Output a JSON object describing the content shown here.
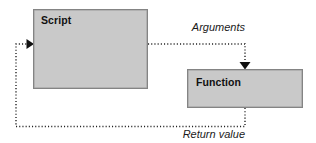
{
  "diagram": {
    "canvas": {
      "width": 316,
      "height": 143,
      "background": "#ffffff"
    },
    "style": {
      "node_fill": "#c9c9c9",
      "node_border": "#848484",
      "edge_color": "#222222",
      "text_color": "#111111"
    },
    "nodes": [
      {
        "id": "script",
        "label": "Script",
        "x": 33,
        "y": 9,
        "width": 115,
        "height": 80,
        "label_x": 41,
        "label_y": 14
      },
      {
        "id": "function",
        "label": "Function",
        "x": 187,
        "y": 69,
        "width": 116,
        "height": 39,
        "label_x": 196,
        "label_y": 76
      }
    ],
    "edges": [
      {
        "id": "arguments-edge",
        "label": "Arguments",
        "from": "script",
        "to": "function",
        "style": "dotted",
        "arrowhead": "down",
        "path": "M148,44 L245,44 L245,64",
        "arrow_points": "239,63 251,63 245,70",
        "label_x": 245,
        "label_y": 22
      },
      {
        "id": "return-value-edge",
        "label": "Return value",
        "from": "function",
        "to": "script",
        "style": "dotted",
        "arrowhead": "right",
        "path": "M245,108 L245,126 L16,126 L16,44 L28,44",
        "arrow_points": "27,39 27,49 34,44",
        "label_x": 245,
        "label_y": 129
      }
    ]
  }
}
